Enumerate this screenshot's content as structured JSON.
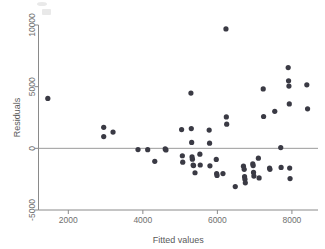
{
  "chart_data": {
    "type": "scatter",
    "title": "",
    "xlabel": "Fitted values",
    "ylabel": "Residuals",
    "xlim": [
      1200,
      8700
    ],
    "ylim": [
      -5000,
      10000
    ],
    "xticks": [
      2000,
      4000,
      6000,
      8000
    ],
    "xtick_labels": [
      "2000",
      "4000",
      "6000",
      "8000"
    ],
    "yticks": [
      -5000,
      0,
      5000,
      10000
    ],
    "ytick_labels": [
      "-5000",
      "0",
      "5000",
      "10000"
    ],
    "grid": false,
    "legend": null,
    "reference_line": {
      "orientation": "horizontal",
      "value": 0
    },
    "marker": {
      "shape": "circle",
      "color": "#3a3a44",
      "size": 2.6
    },
    "points": [
      [
        1450,
        4050
      ],
      [
        2950,
        1700
      ],
      [
        2950,
        950
      ],
      [
        3200,
        1320
      ],
      [
        3870,
        -100
      ],
      [
        4130,
        -110
      ],
      [
        4320,
        -1050
      ],
      [
        4600,
        -50
      ],
      [
        4620,
        -130
      ],
      [
        5040,
        1520
      ],
      [
        5060,
        -600
      ],
      [
        5070,
        -1120
      ],
      [
        5290,
        4480
      ],
      [
        5300,
        1600
      ],
      [
        5310,
        480
      ],
      [
        5320,
        -700
      ],
      [
        5330,
        -880
      ],
      [
        5350,
        -1350
      ],
      [
        5360,
        -1400
      ],
      [
        5400,
        -1980
      ],
      [
        5530,
        -470
      ],
      [
        5540,
        -1350
      ],
      [
        5780,
        1480
      ],
      [
        5790,
        420
      ],
      [
        5800,
        -1420
      ],
      [
        5970,
        -900
      ],
      [
        5980,
        -2050
      ],
      [
        5990,
        -2200
      ],
      [
        6150,
        -2050
      ],
      [
        6230,
        9680
      ],
      [
        6240,
        2550
      ],
      [
        6250,
        1960
      ],
      [
        6480,
        -3100
      ],
      [
        6700,
        -1450
      ],
      [
        6720,
        -1700
      ],
      [
        6730,
        -2300
      ],
      [
        6740,
        -2500
      ],
      [
        6750,
        -2800
      ],
      [
        6950,
        -1250
      ],
      [
        6960,
        -1400
      ],
      [
        6970,
        -1950
      ],
      [
        6980,
        -2250
      ],
      [
        7100,
        -800
      ],
      [
        7120,
        -2400
      ],
      [
        7230,
        4820
      ],
      [
        7240,
        2580
      ],
      [
        7400,
        -1600
      ],
      [
        7410,
        -1700
      ],
      [
        7540,
        3000
      ],
      [
        7700,
        60
      ],
      [
        7710,
        -1550
      ],
      [
        7900,
        6550
      ],
      [
        7910,
        5470
      ],
      [
        7920,
        5050
      ],
      [
        7930,
        3600
      ],
      [
        7940,
        -1600
      ],
      [
        7950,
        -2450
      ],
      [
        8400,
        5150
      ],
      [
        8420,
        3200
      ]
    ]
  },
  "axes": {
    "x_title": "Fitted values",
    "y_title": "Residuals"
  }
}
